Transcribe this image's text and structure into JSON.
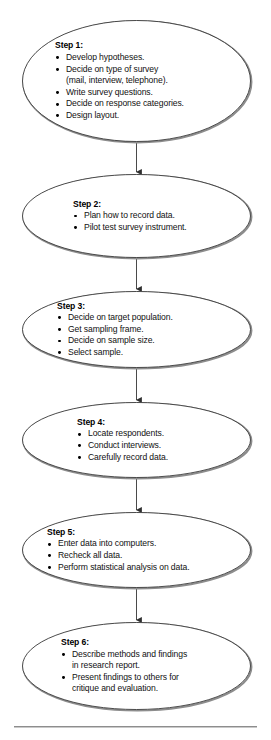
{
  "diagram": {
    "type": "flowchart",
    "shape": "ellipse",
    "connector": "down-arrow",
    "colors": {
      "outline": "#3a3a3a",
      "shadow": "#8a8a8a",
      "text": "#000000",
      "background": "#ffffff",
      "rule": "#8d8d8d"
    },
    "nodes": [
      {
        "id": "step-1",
        "title": "Step 1:",
        "bullets": [
          "Develop hypotheses.",
          "Decide on type of survey\n(mail, interview, telephone).",
          "Write survey questions.",
          "Decide on response categories.",
          "Design layout."
        ]
      },
      {
        "id": "step-2",
        "title": "Step 2:",
        "bullets": [
          "Plan how to record data.",
          "Pilot test survey instrument."
        ]
      },
      {
        "id": "step-3",
        "title": "Step 3:",
        "bullets": [
          "Decide on target population.",
          "Get sampling frame.",
          "Decide on sample size.",
          "Select sample."
        ]
      },
      {
        "id": "step-4",
        "title": "Step 4:",
        "bullets": [
          "Locate respondents.",
          "Conduct interviews.",
          "Carefully record data."
        ]
      },
      {
        "id": "step-5",
        "title": "Step 5:",
        "bullets": [
          "Enter data into computers.",
          "Recheck all data.",
          "Perform statistical analysis on data."
        ]
      },
      {
        "id": "step-6",
        "title": "Step 6:",
        "bullets": [
          "Describe methods and findings\nin research report.",
          "Present findings to others for\ncritique and evaluation."
        ]
      }
    ]
  }
}
